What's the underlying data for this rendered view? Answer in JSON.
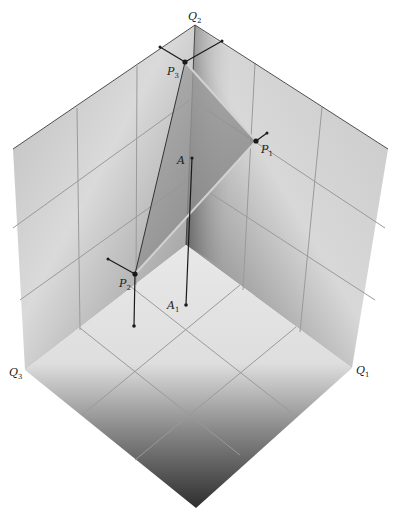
{
  "figure": {
    "type": "3D simplex diagram in cube corner",
    "colors": {
      "background": "#ffffff",
      "wall_light": "#d6d6d6",
      "wall_dark": "#5a5a5a",
      "floor_light": "#e6e6e6",
      "floor_dark": "#3c3c3c",
      "grid": "#9a9a9a",
      "triangle_fill": "#8a8a8a",
      "ink": "#1a1a1a",
      "light_edge": "#cfcfcf"
    },
    "vertices": {
      "top": [
        195,
        25
      ],
      "left_upper": [
        13,
        149
      ],
      "right_upper": [
        388,
        149
      ],
      "q3_corner": [
        25,
        370
      ],
      "q1_corner": [
        352,
        368
      ],
      "bottom": [
        196,
        508
      ],
      "origin": [
        186,
        245
      ]
    },
    "axis_labels": {
      "q1": {
        "base": "Q",
        "sub": "1"
      },
      "q2": {
        "base": "Q",
        "sub": "2"
      },
      "q3": {
        "base": "Q",
        "sub": "3"
      }
    },
    "points": {
      "p1": {
        "base": "P",
        "sub": "1",
        "pos": [
          256,
          141
        ]
      },
      "p2": {
        "base": "P",
        "sub": "2",
        "pos": [
          135,
          274
        ]
      },
      "p3": {
        "base": "P",
        "sub": "3",
        "pos": [
          185,
          62
        ]
      },
      "a": {
        "base": "A",
        "sub": "",
        "pos": [
          192,
          158
        ]
      },
      "a1": {
        "base": "A",
        "sub": "1",
        "pos": [
          186,
          305
        ]
      }
    }
  }
}
